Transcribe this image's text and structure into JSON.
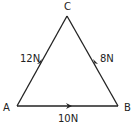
{
  "diagram": {
    "type": "force-triangle",
    "vertices": [
      {
        "id": "A",
        "label": "A",
        "x": 17,
        "y": 106
      },
      {
        "id": "B",
        "label": "B",
        "x": 118,
        "y": 106
      },
      {
        "id": "C",
        "label": "C",
        "x": 67,
        "y": 16
      }
    ],
    "edges": [
      {
        "from": "A",
        "to": "C",
        "label": "12N",
        "arrow_direction": "A→C"
      },
      {
        "from": "B",
        "to": "C",
        "label": "8N",
        "arrow_direction": "B→C"
      },
      {
        "from": "A",
        "to": "B",
        "label": "10N",
        "arrow_direction": "A→B"
      }
    ],
    "colors": {
      "line": "#222222",
      "background": "#ffffff"
    }
  }
}
